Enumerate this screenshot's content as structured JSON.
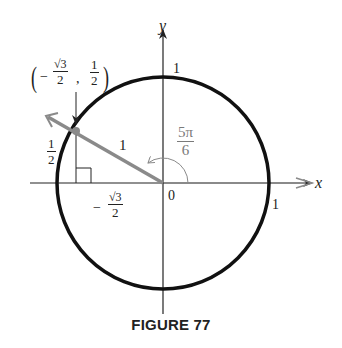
{
  "figure": {
    "caption": "FIGURE 77",
    "axes": {
      "x_label": "x",
      "y_label": "y",
      "origin_label": "0",
      "x_tick_label": "1",
      "y_tick_label": "1"
    },
    "point": {
      "open_paren": "(",
      "close_paren": ")",
      "minus": "−",
      "x_num": "√3",
      "x_den": "2",
      "comma": ",",
      "y_num": "1",
      "y_den": "2"
    },
    "radius_label": "1",
    "angle": {
      "num": "5π",
      "den": "6"
    },
    "height_label": {
      "num": "1",
      "den": "2"
    },
    "base_label": {
      "minus": "−",
      "num": "√3",
      "den": "2"
    },
    "colors": {
      "circle": "#111111",
      "axes": "#222222",
      "ray": "#8a8a8a",
      "angle_label": "#7a7a7a"
    }
  }
}
